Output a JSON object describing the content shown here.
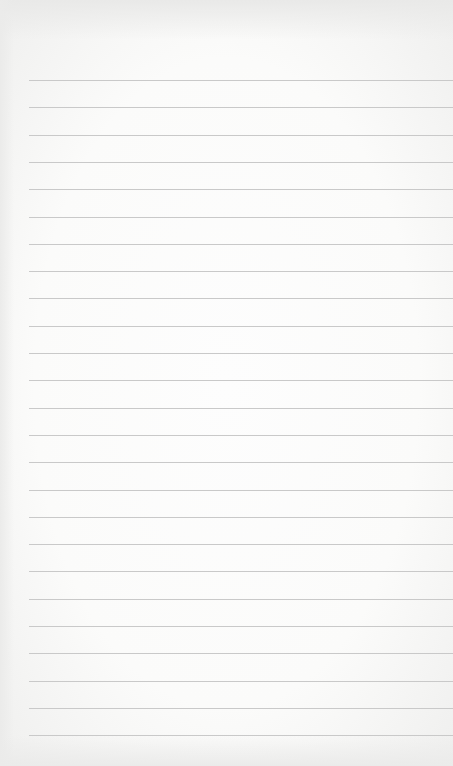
{
  "paper": {
    "type": "lined-notepad-sheet",
    "background_color": "#fbfbfa",
    "line_color": "#c9c9c9",
    "line_count": 25,
    "first_line_y": 80,
    "line_spacing": 27.3,
    "line_left_x": 29
  }
}
